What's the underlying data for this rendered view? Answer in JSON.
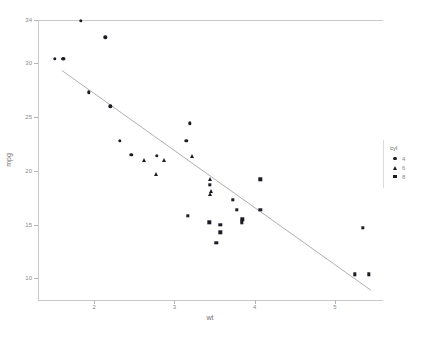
{
  "chart_data": {
    "type": "scatter",
    "title": "",
    "xlabel": "wt",
    "ylabel": "mpg",
    "xlim": [
      1.3,
      5.6
    ],
    "ylim": [
      8.0,
      34.0
    ],
    "xticks": [
      2,
      3,
      4,
      5
    ],
    "yticks": [
      10,
      15,
      20,
      25,
      30,
      34
    ],
    "grid": false,
    "legend": {
      "title": "cyl",
      "position": "right",
      "entries": [
        {
          "label": "4",
          "marker": "circle"
        },
        {
          "label": "6",
          "marker": "triangle"
        },
        {
          "label": "8",
          "marker": "square"
        }
      ]
    },
    "series": [
      {
        "name": "4",
        "marker": "circle",
        "points": [
          {
            "x": 1.513,
            "y": 30.4
          },
          {
            "x": 1.615,
            "y": 30.4
          },
          {
            "x": 1.835,
            "y": 33.9
          },
          {
            "x": 1.935,
            "y": 27.3
          },
          {
            "x": 2.14,
            "y": 32.4
          },
          {
            "x": 2.2,
            "y": 26.0
          },
          {
            "x": 2.32,
            "y": 22.8
          },
          {
            "x": 2.465,
            "y": 21.5
          },
          {
            "x": 2.78,
            "y": 21.4
          },
          {
            "x": 3.15,
            "y": 22.8
          },
          {
            "x": 3.19,
            "y": 24.4
          },
          {
            "x": 1.615,
            "y": 30.4
          }
        ]
      },
      {
        "name": "6",
        "marker": "triangle",
        "points": [
          {
            "x": 2.62,
            "y": 21.0
          },
          {
            "x": 2.875,
            "y": 21.0
          },
          {
            "x": 3.215,
            "y": 21.4
          },
          {
            "x": 3.44,
            "y": 19.2
          },
          {
            "x": 3.44,
            "y": 17.8
          },
          {
            "x": 3.46,
            "y": 18.1
          },
          {
            "x": 2.77,
            "y": 19.7
          }
        ]
      },
      {
        "name": "8",
        "marker": "square",
        "points": [
          {
            "x": 3.44,
            "y": 18.7
          },
          {
            "x": 3.57,
            "y": 14.3
          },
          {
            "x": 3.57,
            "y": 15.0
          },
          {
            "x": 3.73,
            "y": 17.3
          },
          {
            "x": 3.78,
            "y": 16.4
          },
          {
            "x": 3.84,
            "y": 15.2
          },
          {
            "x": 3.845,
            "y": 15.5
          },
          {
            "x": 4.07,
            "y": 19.2
          },
          {
            "x": 5.25,
            "y": 10.4
          },
          {
            "x": 5.345,
            "y": 14.7
          },
          {
            "x": 5.424,
            "y": 10.4
          },
          {
            "x": 3.17,
            "y": 15.8
          },
          {
            "x": 3.435,
            "y": 15.2
          },
          {
            "x": 4.07,
            "y": 16.4
          },
          {
            "x": 3.52,
            "y": 13.3
          }
        ]
      }
    ],
    "fit_line": {
      "type": "linear-regression",
      "x_start": 1.6,
      "y_start": 29.3,
      "x_end": 5.45,
      "y_end": 8.9
    }
  }
}
